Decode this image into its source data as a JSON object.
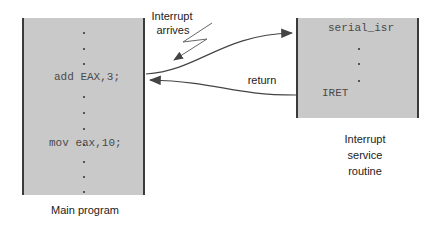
{
  "diagram": {
    "main_program": {
      "label": "Main program",
      "lines": {
        "instruction_1": "add EAX,3;",
        "instruction_2": "mov eax,10;"
      }
    },
    "isr": {
      "title": "serial_isr",
      "return_instruction": "IRET",
      "label_line_1": "Interrupt",
      "label_line_2": "service",
      "label_line_3": "routine"
    },
    "annotations": {
      "interrupt_line_1": "Interrupt",
      "interrupt_line_2": "arrives",
      "return": "return"
    },
    "colors": {
      "box_fill": "#c9c9c9",
      "box_border": "#3a3a3a",
      "arrow": "#444444"
    }
  }
}
